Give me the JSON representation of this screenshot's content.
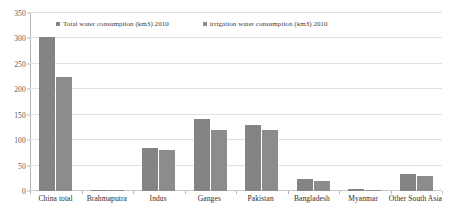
{
  "chart_data": {
    "type": "bar",
    "title": "",
    "subtitle": "",
    "xlabel": "",
    "ylabel": "",
    "ylim": [
      0,
      350
    ],
    "ytick_step": 50,
    "yticks": [
      0,
      50,
      100,
      150,
      200,
      250,
      300,
      350
    ],
    "grid": true,
    "legend_position": "top-inside",
    "categories": [
      "China total",
      "Brahmaputra",
      "Indus",
      "Ganges",
      "Pakistan",
      "Bangladesh",
      "Myanmar",
      "Other South Asia"
    ],
    "series": [
      {
        "name": "Total water consumption (km3) 2010",
        "color": "#848484",
        "values": [
          302,
          2,
          84,
          141,
          130,
          23,
          3,
          33
        ]
      },
      {
        "name": "irrigation water consumption (km3) 2010",
        "color": "#8c8c8c",
        "values": [
          225,
          1,
          80,
          119,
          120,
          19,
          2,
          30
        ]
      }
    ]
  },
  "legend": {
    "items": [
      {
        "label": "Total water consumption (km3) 2010"
      },
      {
        "label": "irrigation water consumption (km3) 2010"
      }
    ]
  },
  "axis": {
    "y_tick_labels": [
      "350",
      "300",
      "250",
      "200",
      "150",
      "100",
      "50",
      "0"
    ]
  }
}
